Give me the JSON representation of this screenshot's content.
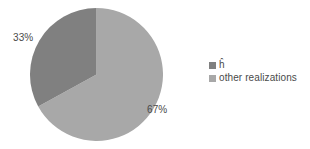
{
  "chart_data": {
    "type": "pie",
    "title": "",
    "categories": [
      "ĥ",
      "other realizations"
    ],
    "values": [
      33,
      67
    ],
    "value_unit": "%",
    "data_labels": [
      "33%",
      "67%"
    ],
    "colors": [
      "#808080",
      "#a8a8a8"
    ],
    "start_angle_deg": 0,
    "direction": "clockwise",
    "legend": {
      "position": "right",
      "entries": [
        {
          "label": "ĥ",
          "color": "#808080",
          "value": 33
        },
        {
          "label": "other realizations",
          "color": "#a8a8a8",
          "value": 67
        }
      ]
    },
    "grid": false,
    "xlabel": "",
    "ylabel": "",
    "background": "#ffffff",
    "text_color": "#4a4a4a"
  }
}
